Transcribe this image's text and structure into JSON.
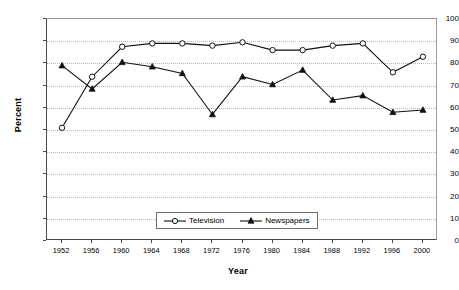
{
  "chart_data": {
    "type": "line",
    "title": "",
    "xlabel": "Year",
    "ylabel": "Percent",
    "x": [
      1952,
      1956,
      1960,
      1964,
      1968,
      1972,
      1976,
      1980,
      1984,
      1988,
      1992,
      1996,
      2000
    ],
    "xtick_labels": [
      "1952",
      "1956",
      "1960",
      "1964",
      "1968",
      "1972",
      "1976",
      "1980",
      "1984",
      "1988",
      "1992",
      "1996",
      "2000"
    ],
    "ytick_labels": [
      "0",
      "10",
      "20",
      "30",
      "40",
      "50",
      "60",
      "70",
      "80",
      "90",
      "100"
    ],
    "ylim": [
      0,
      100
    ],
    "ytick_step": 10,
    "grid": "horizontal-dotted",
    "legend_position": "bottom-center-inside",
    "series": [
      {
        "name": "Television",
        "marker": "open-circle",
        "color": "#111111",
        "values": [
          51,
          74,
          87.5,
          89,
          89,
          88,
          89.5,
          86,
          86,
          88,
          89,
          76,
          83
        ]
      },
      {
        "name": "Newspapers",
        "marker": "filled-triangle",
        "color": "#111111",
        "values": [
          79,
          68.5,
          80.5,
          78.5,
          75.5,
          57,
          74,
          70.5,
          77,
          63.5,
          65.5,
          58,
          59
        ]
      }
    ]
  },
  "legend": {
    "entries": [
      {
        "label": "Television"
      },
      {
        "label": "Newspapers"
      }
    ]
  },
  "axes": {
    "y_title": "Percent",
    "x_title": "Year"
  }
}
